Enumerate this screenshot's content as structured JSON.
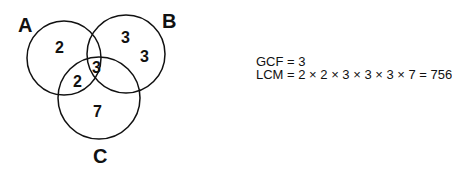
{
  "venn": {
    "sets": {
      "A": "A",
      "B": "B",
      "C": "C"
    },
    "regions": {
      "a_only": "2",
      "b_only_1": "3",
      "b_only_2": "3",
      "abc": "3",
      "ac": "2",
      "c_only": "7"
    }
  },
  "equations": {
    "gcf": "GCF = 3",
    "lcm": "LCM = 2 × 2 × 3 × 3 × 3 × 7 = 756"
  }
}
